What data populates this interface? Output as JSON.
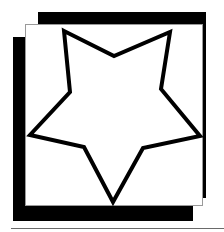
{
  "figure": {
    "colors": {
      "background": "#ffffff",
      "frame": "#000000",
      "panel": "#ffffff",
      "panel_border": "#9a9a9a",
      "star_stroke": "#000000",
      "star_fill": "#ffffff",
      "baseline": "#6a6a6a"
    },
    "star": {
      "points": "64,31 114,56 170,32 161,89 200,136 143,148 113,202 84,147 30,135 70,92",
      "stroke_width": 4
    }
  }
}
